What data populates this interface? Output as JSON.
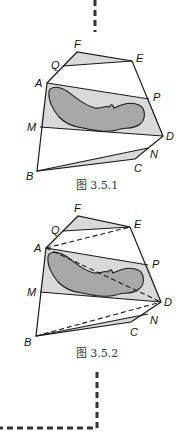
{
  "figures": [
    {
      "id": "fig1",
      "caption": "图 3.5.1",
      "caption_pos": [
        97,
        180
      ],
      "points": {
        "F": [
          77,
          52
        ],
        "E": [
          132,
          61
        ],
        "Q": [
          63,
          66
        ],
        "A": [
          47,
          83
        ],
        "P": [
          149,
          99
        ],
        "M": [
          40,
          127
        ],
        "D": [
          163,
          136
        ],
        "N": [
          148,
          148
        ],
        "C": [
          135,
          159
        ],
        "B": [
          37,
          171
        ]
      },
      "labels": {
        "F": [
          74,
          48
        ],
        "Q": [
          51,
          69
        ],
        "E": [
          136,
          62
        ],
        "A": [
          35,
          87
        ],
        "P": [
          153,
          101
        ],
        "M": [
          27,
          131
        ],
        "D": [
          166,
          140
        ],
        "N": [
          150,
          158
        ],
        "C": [
          134,
          172
        ],
        "B": [
          26,
          180
        ]
      },
      "dashed": []
    },
    {
      "id": "fig2",
      "caption": "图 3.5.2",
      "caption_pos": [
        97,
        350
      ],
      "points": {
        "F": [
          78,
          216
        ],
        "E": [
          130,
          227
        ],
        "Q": [
          63,
          231
        ],
        "A": [
          46,
          248
        ],
        "P": [
          148,
          265
        ],
        "M": [
          40,
          292
        ],
        "D": [
          161,
          302
        ],
        "N": [
          148,
          314
        ],
        "C": [
          131,
          322
        ],
        "B": [
          36,
          336
        ]
      },
      "labels": {
        "F": [
          74,
          212
        ],
        "Q": [
          51,
          234
        ],
        "E": [
          134,
          228
        ],
        "A": [
          34,
          252
        ],
        "P": [
          152,
          268
        ],
        "M": [
          27,
          296
        ],
        "D": [
          164,
          306
        ],
        "N": [
          150,
          324
        ],
        "C": [
          130,
          336
        ],
        "B": [
          24,
          346
        ]
      },
      "dashed": [
        [
          "A",
          "E"
        ],
        [
          "A",
          "D"
        ],
        [
          "B",
          "D"
        ]
      ]
    }
  ],
  "connectors": {
    "top_dash": {
      "x": 95,
      "y1": 0,
      "y2": 32
    },
    "bottom_dash": {
      "x": 97,
      "y1": 372,
      "y2": 428,
      "x_end": 0
    }
  },
  "colors": {
    "line": "#1a1a1a",
    "band_fill": "#d9d9d9",
    "lake_fill": "#a8a8a8",
    "dash": "#333333"
  }
}
